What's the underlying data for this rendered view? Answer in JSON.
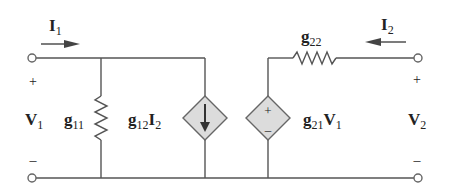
{
  "diagram": {
    "colors": {
      "wire": "#555555",
      "source_fill": "#dcdcdc",
      "text": "#222222"
    },
    "port1": {
      "current_label": "I",
      "current_sub": "1",
      "voltage_label": "V",
      "voltage_sub": "1",
      "plus": "+",
      "minus": "–"
    },
    "port2": {
      "current_label": "I",
      "current_sub": "2",
      "voltage_label": "V",
      "voltage_sub": "2",
      "plus": "+",
      "minus": "–"
    },
    "g11": {
      "label": "g",
      "sub": "11"
    },
    "g22": {
      "label": "g",
      "sub": "22"
    },
    "current_source": {
      "coef": "g",
      "coef_sub": "12",
      "var": "I",
      "var_sub": "2"
    },
    "voltage_source": {
      "coef": "g",
      "coef_sub": "21",
      "var": "V",
      "var_sub": "1",
      "plus": "+",
      "minus": "–"
    }
  }
}
